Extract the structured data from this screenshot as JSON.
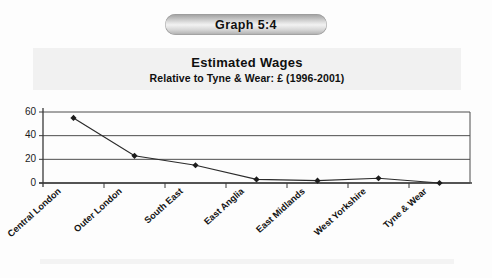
{
  "figure": {
    "number_label": "Graph 5:4",
    "title": "Estimated Wages",
    "subtitle": "Relative to Tyne & Wear: £ (1996-2001)"
  },
  "chart_data": {
    "type": "line",
    "title": "Estimated Wages",
    "subtitle": "Relative to Tyne & Wear: £ (1996-2001)",
    "xlabel": "",
    "ylabel": "",
    "ylim": [
      0,
      60
    ],
    "yticks": [
      0,
      20,
      40,
      60
    ],
    "ytick_labels": [
      "0",
      "20",
      "40",
      "60"
    ],
    "grid": true,
    "legend": "none",
    "marker": "diamond",
    "categories": [
      "Central London",
      "Outer London",
      "South East",
      "East Anglia",
      "East Midlands",
      "West Yorkshire",
      "Tyne & Wear"
    ],
    "values": [
      55,
      23,
      15,
      3,
      2,
      4,
      0
    ]
  }
}
